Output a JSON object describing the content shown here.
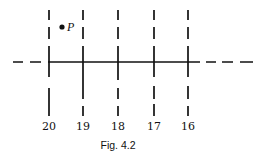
{
  "figure": {
    "caption": "Fig. 4.2",
    "point": {
      "label": "P",
      "x": 62,
      "y": 27
    },
    "line_color": "#111111",
    "horizontal_line": {
      "y": 62,
      "solid_from": 48,
      "solid_to": 200,
      "left_dashes": [
        [
          13,
          23
        ],
        [
          30,
          41
        ]
      ],
      "right_dashes": [
        [
          206,
          216
        ],
        [
          222,
          233
        ],
        [
          240,
          253
        ]
      ]
    },
    "vertical_lines": [
      {
        "label": "20",
        "x": 49,
        "segments": [
          [
            10,
            20
          ],
          [
            27,
            39
          ],
          [
            46,
            77
          ],
          [
            88,
            116
          ]
        ]
      },
      {
        "label": "19",
        "x": 83,
        "segments": [
          [
            10,
            20
          ],
          [
            27,
            39
          ],
          [
            46,
            99
          ],
          [
            106,
            116
          ]
        ]
      },
      {
        "label": "18",
        "x": 118,
        "segments": [
          [
            10,
            20
          ],
          [
            27,
            39
          ],
          [
            46,
            80
          ],
          [
            88,
            99
          ],
          [
            106,
            116
          ]
        ]
      },
      {
        "label": "17",
        "x": 154,
        "segments": [
          [
            10,
            20
          ],
          [
            27,
            39
          ],
          [
            46,
            77
          ],
          [
            86,
            99
          ],
          [
            104,
            116
          ]
        ]
      },
      {
        "label": "16",
        "x": 188,
        "segments": [
          [
            10,
            20
          ],
          [
            27,
            39
          ],
          [
            46,
            77
          ],
          [
            86,
            99
          ],
          [
            106,
            116
          ]
        ]
      }
    ]
  }
}
